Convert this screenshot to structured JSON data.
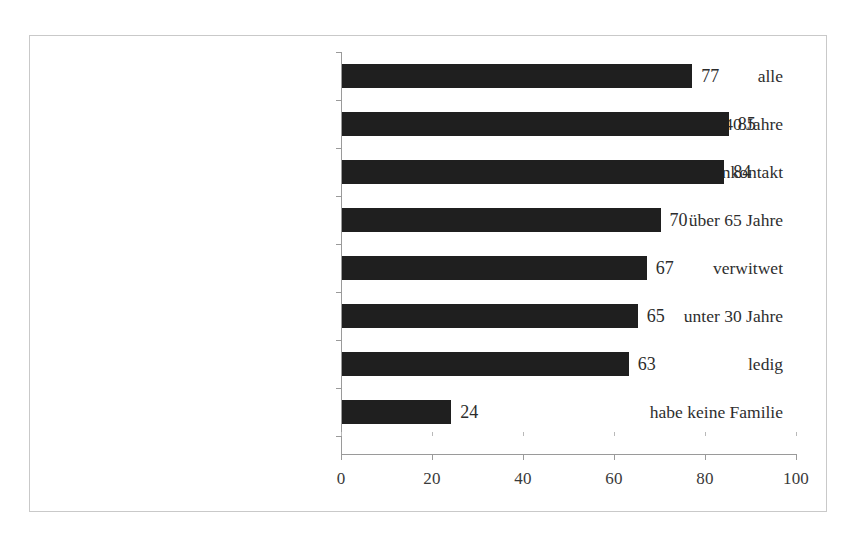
{
  "chart_data": {
    "type": "bar",
    "orientation": "horizontal",
    "title": "",
    "subtitle": "",
    "xlabel": "",
    "ylabel": "",
    "categories": [
      "alle",
      "über 40 Jahre",
      "sehr häufig Familienkontakt",
      "über 65 Jahre",
      "verwitwet",
      "unter 30 Jahre",
      "ledig",
      "habe keine Familie"
    ],
    "values": [
      77,
      85,
      84,
      70,
      67,
      65,
      63,
      24
    ],
    "data_labels": [
      "77",
      "85",
      "84",
      "70",
      "67",
      "65",
      "63",
      "24"
    ],
    "xlim": [
      0,
      100
    ],
    "xticks": [
      0,
      20,
      40,
      60,
      80,
      100
    ],
    "xtick_labels": [
      "0",
      "20",
      "40",
      "60",
      "80",
      "100"
    ],
    "grid": false,
    "legend": false,
    "legend_position": "none",
    "bar_color": "#1f1f1f",
    "axis_color": "#9a9a9a",
    "text_color": "#2e2e2e",
    "background": "#ffffff",
    "border_color": "#c9c9c9"
  }
}
